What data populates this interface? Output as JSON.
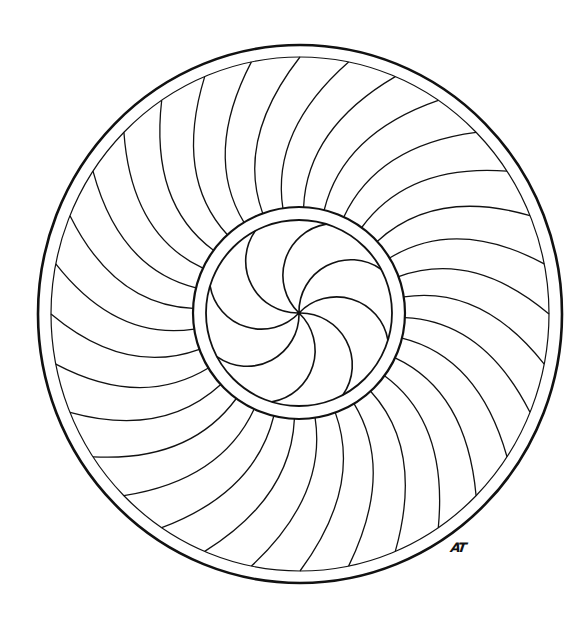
{
  "page": {
    "background": "#ffffff",
    "ink_color": "#111111"
  },
  "signature": {
    "text": "AT"
  },
  "mandala": {
    "center": [
      300,
      314
    ],
    "outer_ring": {
      "outer_rx": 262,
      "outer_ry": 269,
      "outer_stroke": 2.6,
      "inner_rx": 249,
      "inner_ry": 257,
      "inner_stroke": 1.2
    },
    "inner_ring": {
      "outer_r": 106,
      "inner_r": 93,
      "outer_stroke": 2.2,
      "inner_stroke": 1.8,
      "center": [
        299,
        313
      ]
    },
    "outer_spokes": {
      "count": 32,
      "start_angle_deg": -110,
      "end_offset_deg": 20,
      "bulge_offset_deg": -10,
      "bulge_radius": 185,
      "stroke": 1.3
    },
    "inner_spiral": {
      "count": 8,
      "start_angle_deg": -118,
      "arc_radius": 52,
      "stroke": 1.6
    }
  }
}
